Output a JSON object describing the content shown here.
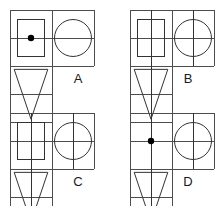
{
  "figure": {
    "name": "orthographic-projection-multiple-choice",
    "background_color": "#ffffff",
    "line_color": "#4d4d4d",
    "dark_line_color": "#333333",
    "dot_color": "#000000",
    "label_color": "#1a1a1a",
    "canvas": {
      "width": 219,
      "height": 206
    }
  },
  "panels": [
    {
      "id": "A",
      "label": "A",
      "label_x": 78,
      "label_y": 80,
      "origin_x": 10,
      "origin_y": 10,
      "cell_w": 42,
      "cell_h": 28,
      "front_view": {
        "name": "square-with-center-dot",
        "has_inner_square": true,
        "has_center_dot": true,
        "has_horizontal_centerline": true,
        "has_vertical_centerline": false
      },
      "side_view": {
        "name": "circle",
        "has_circle": true,
        "has_horizontal_centerline": true,
        "has_vertical_centerline": false
      },
      "top_view": {
        "name": "inverted-triangle",
        "has_triangle": true,
        "has_vertical_centerline": false
      }
    },
    {
      "id": "B",
      "label": "B",
      "label_x": 188,
      "label_y": 80,
      "origin_x": 130,
      "origin_y": 10,
      "cell_w": 42,
      "cell_h": 28,
      "front_view": {
        "name": "square-plain",
        "has_inner_square": true,
        "has_center_dot": false,
        "has_horizontal_centerline": true,
        "has_vertical_centerline": true
      },
      "side_view": {
        "name": "circle-with-crosshair",
        "has_circle": true,
        "has_horizontal_centerline": true,
        "has_vertical_centerline": true
      },
      "top_view": {
        "name": "inverted-triangle",
        "has_triangle": true,
        "has_vertical_centerline": true
      }
    },
    {
      "id": "C",
      "label": "C",
      "label_x": 78,
      "label_y": 183,
      "origin_x": 10,
      "origin_y": 113,
      "cell_w": 42,
      "cell_h": 28,
      "front_view": {
        "name": "square-plain",
        "has_inner_square": true,
        "has_center_dot": false,
        "has_horizontal_centerline": true,
        "has_vertical_centerline": true
      },
      "side_view": {
        "name": "circle-with-crosshair",
        "has_circle": true,
        "has_horizontal_centerline": true,
        "has_vertical_centerline": true
      },
      "top_view": {
        "name": "inverted-triangle",
        "has_triangle": true,
        "has_vertical_centerline": true
      }
    },
    {
      "id": "D",
      "label": "D",
      "label_x": 188,
      "label_y": 183,
      "origin_x": 130,
      "origin_y": 113,
      "cell_w": 42,
      "cell_h": 28,
      "front_view": {
        "name": "center-dot-only",
        "has_inner_square": false,
        "has_center_dot": true,
        "has_horizontal_centerline": true,
        "has_vertical_centerline": true
      },
      "side_view": {
        "name": "circle-with-vertical-centerline",
        "has_circle": true,
        "has_horizontal_centerline": false,
        "has_vertical_centerline": true
      },
      "top_view": {
        "name": "inverted-triangle",
        "has_triangle": true,
        "has_vertical_centerline": true
      }
    }
  ]
}
